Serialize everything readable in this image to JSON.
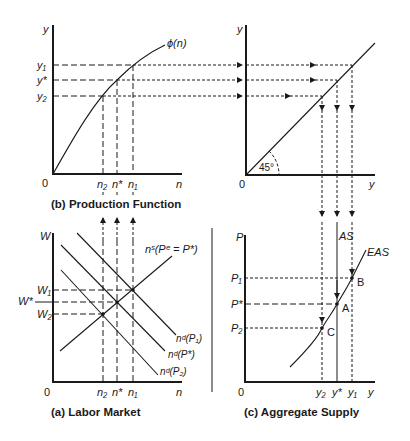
{
  "panels": {
    "production": {
      "caption": "(b) Production Function",
      "y_axis": "y",
      "x_axis": "n",
      "origin": "0",
      "curve_label": "ϕ(n)",
      "y_ticks": [
        "y₁",
        "y*",
        "y₂"
      ],
      "x_ticks": [
        "n₂",
        "n*",
        "n₁"
      ]
    },
    "forty_five": {
      "y_axis": "y",
      "x_axis": "y",
      "origin": "0",
      "angle_label": "45°"
    },
    "labor": {
      "caption": "(a) Labor Market",
      "y_axis": "W",
      "x_axis": "n",
      "origin": "0",
      "w_ticks": [
        "W₁",
        "W*",
        "W₂"
      ],
      "x_ticks": [
        "n₂",
        "n*",
        "n₁"
      ],
      "supply_label": "nˢ(Pᵉ = P*)",
      "demand_labels": [
        "nᵈ(P₁)",
        "nᵈ(P*)",
        "nᵈ(P₂)"
      ]
    },
    "aggregate": {
      "caption": "(c) Aggregate Supply",
      "y_axis": "P",
      "x_axis": "y",
      "origin": "0",
      "p_ticks": [
        "P₁",
        "P*",
        "P₂"
      ],
      "x_ticks": [
        "y₂",
        "y*",
        "y₁"
      ],
      "as_label": "AS",
      "eas_label": "EAS",
      "points": [
        "B",
        "A",
        "C"
      ]
    }
  }
}
